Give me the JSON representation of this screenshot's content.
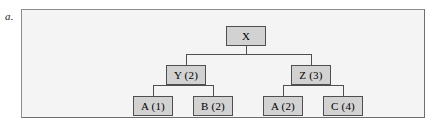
{
  "figure": {
    "label": "a.",
    "panel_background": "#f4f4f4",
    "panel_border_color": "#8d8d8d",
    "node_fill": "#d2d2d2",
    "node_border_color": "#4f4f4f",
    "connector_color": "#4f4f4f"
  },
  "tree": {
    "nodes": [
      {
        "id": "x",
        "label": "X",
        "level": "root",
        "cx": 204,
        "cy": 16
      },
      {
        "id": "y",
        "label": "Y (2)",
        "level": "middle",
        "cx": 144,
        "cy": 55
      },
      {
        "id": "z",
        "label": "Z (3)",
        "level": "middle",
        "cx": 269,
        "cy": 55
      },
      {
        "id": "a1",
        "label": "A (1)",
        "level": "leaf",
        "cx": 111,
        "cy": 86
      },
      {
        "id": "b2",
        "label": "B (2)",
        "level": "leaf",
        "cx": 171,
        "cy": 86
      },
      {
        "id": "a2",
        "label": "A (2)",
        "level": "leaf",
        "cx": 241,
        "cy": 86
      },
      {
        "id": "c4",
        "label": "C (4)",
        "level": "leaf",
        "cx": 301,
        "cy": 86
      }
    ],
    "edges": [
      {
        "from": "x",
        "to": "y"
      },
      {
        "from": "x",
        "to": "z"
      },
      {
        "from": "y",
        "to": "a1"
      },
      {
        "from": "y",
        "to": "b2"
      },
      {
        "from": "z",
        "to": "a2"
      },
      {
        "from": "z",
        "to": "c4"
      }
    ]
  }
}
